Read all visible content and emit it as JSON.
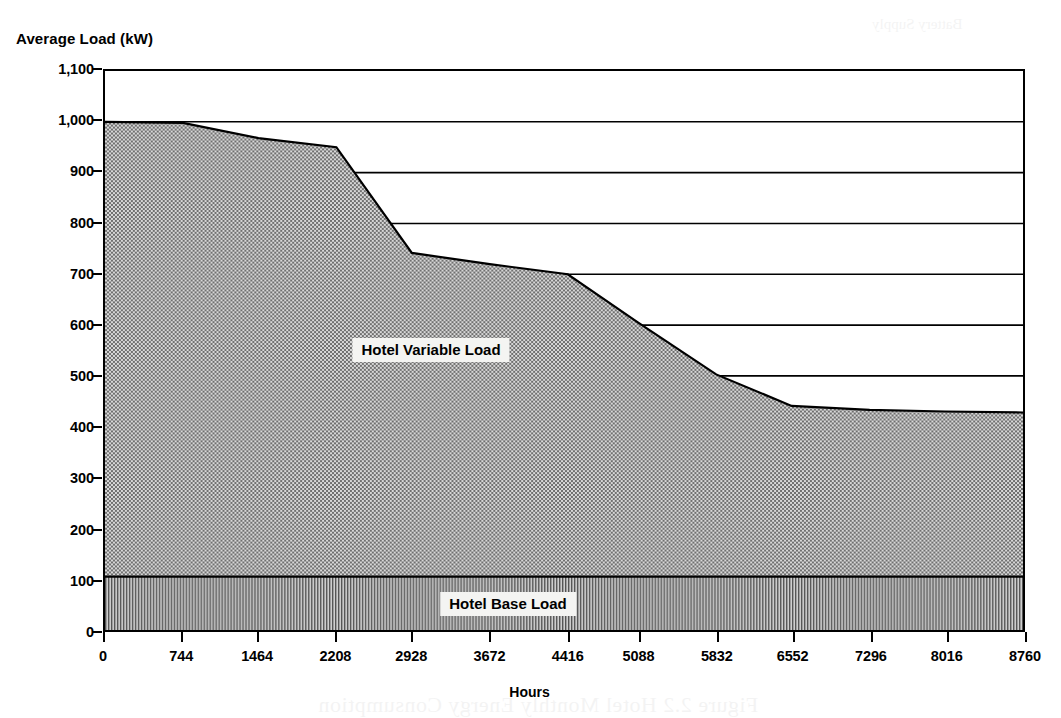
{
  "chart_data": {
    "type": "area",
    "title": "",
    "xlabel": "Hours",
    "ylabel": "Average Load (kW)",
    "xlim": [
      0,
      8760
    ],
    "ylim": [
      0,
      1100
    ],
    "grid": "horizontal",
    "legend_position": "in-plot-annotations",
    "x_ticks": [
      0,
      744,
      1464,
      2208,
      2928,
      3672,
      4416,
      5088,
      5832,
      6552,
      7296,
      8016,
      8760
    ],
    "x_tick_labels": [
      "0",
      "744",
      "1464",
      "2208",
      "2928",
      "3672",
      "4416",
      "5088",
      "5832",
      "6552",
      "7296",
      "8016",
      "8760"
    ],
    "y_ticks": [
      0,
      100,
      200,
      300,
      400,
      500,
      600,
      700,
      800,
      900,
      1000,
      1100
    ],
    "y_tick_labels": [
      "0",
      "100",
      "200",
      "300",
      "400",
      "500",
      "600",
      "700",
      "800",
      "900",
      "1,000",
      "1,100"
    ],
    "series": [
      {
        "name": "Hotel Variable Load",
        "fill": "checker-gray",
        "fill_color": "#9a9a9a",
        "x": [
          0,
          744,
          1464,
          2208,
          2928,
          3672,
          4416,
          5088,
          5832,
          6552,
          7296,
          8016,
          8760
        ],
        "values": [
          1000,
          998,
          968,
          950,
          742,
          720,
          700,
          605,
          503,
          441,
          433,
          430,
          428
        ]
      },
      {
        "name": "Hotel Base Load",
        "fill": "vertical-lines",
        "fill_color": "#777777",
        "x": [
          0,
          8760
        ],
        "values": [
          105,
          105
        ]
      }
    ],
    "annotations": [
      {
        "text": "Hotel Variable Load",
        "x": 3100,
        "y": 520
      },
      {
        "text": "Hotel Base Load",
        "x": 3950,
        "y": 55
      }
    ]
  },
  "axes": {
    "y_title": "Average Load (kW)",
    "x_title": "Hours"
  },
  "labels": {
    "variable_load": "Hotel Variable Load",
    "base_load": "Hotel Base Load"
  },
  "bleed": {
    "top": "Battery Supply",
    "mid": "2.2-2",
    "bottom": "Figure 2.2  Hotel Monthly Energy Consumption"
  },
  "colors": {
    "axis": "#000000",
    "variable_fill": "#9a9a9a",
    "base_fill": "#777777",
    "page_background": "#ffffff",
    "label_background": "#f4f4f2"
  }
}
